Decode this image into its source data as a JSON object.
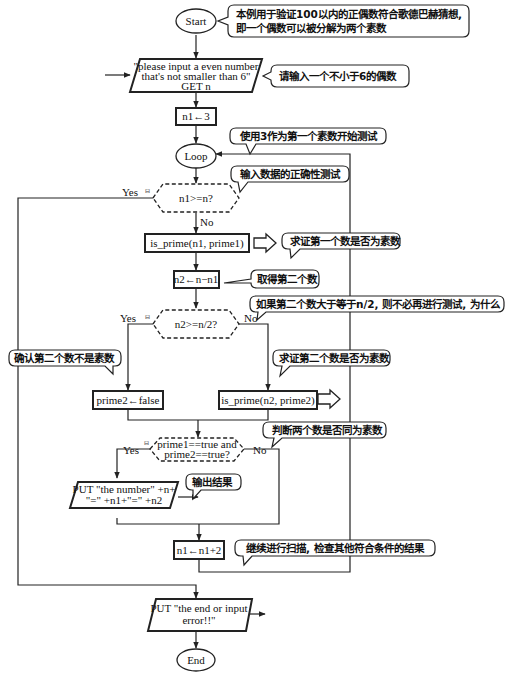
{
  "terminals": {
    "start": "Start",
    "loop": "Loop",
    "end": "End"
  },
  "io": {
    "input_line1": "\"please input a even number",
    "input_line2": "that's not smaller than 6\"",
    "input_line3": "GET n",
    "output_line1": "PUT \"the number\" +n+",
    "output_line2": "\"=\" +n1+\"=\" +n2",
    "end_line1": "PUT \"the end or input",
    "end_line2": "error!!\""
  },
  "process": {
    "init": "n1←3",
    "is_prime1": "is_prime(n1, prime1)",
    "n2_assign": "n2←n−n1",
    "prime2_false": "prime2←false",
    "is_prime2": "is_prime(n2, prime2)",
    "increment": "n1←n1+2"
  },
  "decisions": {
    "d1": "n1>=n?",
    "d2": "n2>=n/2?",
    "d3_line1": "prime1==true and",
    "d3_line2": "prime2==true?"
  },
  "labels": {
    "yes": "Yes",
    "no": "No",
    "collapse": "⊟"
  },
  "comments": {
    "c1_line1": "本例用于验证100以内的正偶数符合歌德巴赫猜想,",
    "c1_line2": "即一个偶数可以被分解为两个素数",
    "c2": "请输入一个不小于6的偶数",
    "c3": "使用3作为第一个素数开始测试",
    "c4": "输入数据的正确性测试",
    "c5": "求证第一个数是否为素数",
    "c6": "取得第二个数",
    "c7": "如果第二个数大于等于n/2, 则不必再进行测试, 为什么",
    "c8": "确认第二个数不是素数",
    "c9": "求证第二个数是否为素数",
    "c10": "判断两个数是否同为素数",
    "c11": "输出结果",
    "c12": "继续进行扫描, 检查其他符合条件的结果"
  }
}
